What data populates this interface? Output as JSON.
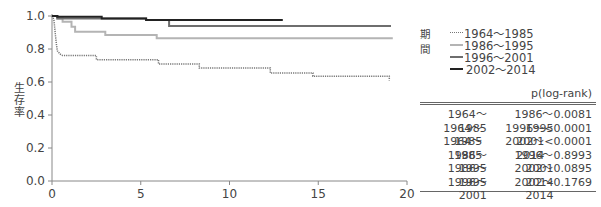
{
  "chart_data": {
    "type": "line",
    "subtype": "kaplan-meier step",
    "title": "",
    "xlabel": "(年)",
    "ylabel": "生存率",
    "xlim": [
      0,
      20
    ],
    "ylim": [
      0,
      1.0
    ],
    "x_ticks": [
      0,
      5,
      10,
      15,
      20
    ],
    "x_tick_labels": [
      "0",
      "5",
      "10",
      "15",
      "20"
    ],
    "y_ticks": [
      0.0,
      0.2,
      0.4,
      0.6,
      0.8,
      1.0
    ],
    "y_tick_labels": [
      "0.0",
      "0.2",
      "0.4",
      "0.6",
      "0.8",
      "1.0"
    ],
    "grid": false,
    "legend_position": "right",
    "legend_title": "期間",
    "series": [
      {
        "name": "1964〜1985",
        "color": "#777777",
        "style": "dotted",
        "width": 1.5,
        "points": [
          [
            0,
            1.0
          ],
          [
            0.1,
            0.98
          ],
          [
            0.15,
            0.93
          ],
          [
            0.2,
            0.88
          ],
          [
            0.25,
            0.83
          ],
          [
            0.3,
            0.79
          ],
          [
            0.45,
            0.77
          ],
          [
            0.6,
            0.76
          ],
          [
            2.5,
            0.76
          ],
          [
            2.5,
            0.735
          ],
          [
            6.0,
            0.735
          ],
          [
            6.0,
            0.71
          ],
          [
            8.3,
            0.71
          ],
          [
            8.3,
            0.685
          ],
          [
            12.3,
            0.685
          ],
          [
            12.3,
            0.655
          ],
          [
            14.7,
            0.655
          ],
          [
            14.7,
            0.635
          ],
          [
            19.0,
            0.635
          ],
          [
            19.0,
            0.61
          ]
        ]
      },
      {
        "name": "1986〜1995",
        "color": "#b4b4b4",
        "style": "solid",
        "width": 2,
        "points": [
          [
            0,
            1.0
          ],
          [
            0.3,
            1.0
          ],
          [
            0.3,
            0.985
          ],
          [
            0.6,
            0.985
          ],
          [
            0.6,
            0.965
          ],
          [
            1.1,
            0.965
          ],
          [
            1.1,
            0.935
          ],
          [
            1.3,
            0.935
          ],
          [
            1.3,
            0.905
          ],
          [
            3.0,
            0.905
          ],
          [
            3.0,
            0.885
          ],
          [
            5.9,
            0.885
          ],
          [
            5.9,
            0.865
          ],
          [
            19.2,
            0.865
          ]
        ]
      },
      {
        "name": "1996〜2001",
        "color": "#6e6e6e",
        "style": "solid",
        "width": 2,
        "points": [
          [
            0,
            1.0
          ],
          [
            0.3,
            1.0
          ],
          [
            0.3,
            0.985
          ],
          [
            5.3,
            0.985
          ],
          [
            5.3,
            0.975
          ],
          [
            6.6,
            0.975
          ],
          [
            6.6,
            0.94
          ],
          [
            19.1,
            0.94
          ]
        ]
      },
      {
        "name": "2002〜2014",
        "color": "#222222",
        "style": "solid",
        "width": 2,
        "points": [
          [
            0,
            1.0
          ],
          [
            0.3,
            1.0
          ],
          [
            0.3,
            0.995
          ],
          [
            2.8,
            0.995
          ],
          [
            2.8,
            0.985
          ],
          [
            5.3,
            0.985
          ],
          [
            5.3,
            0.975
          ],
          [
            13.0,
            0.975
          ]
        ]
      }
    ],
    "logrank_table": {
      "header": [
        "",
        "",
        "p(log-rank)"
      ],
      "rows": [
        [
          "1964〜1985",
          "1986〜1995",
          "0.0081"
        ],
        [
          "1964〜1985",
          "1996〜2001",
          "<0.0001"
        ],
        [
          "1964〜1985",
          "2002〜2014",
          "<0.0001"
        ],
        [
          "1986〜1995",
          "1996〜2001",
          "0.8993"
        ],
        [
          "1986〜1995",
          "2002〜2014",
          "0.0895"
        ],
        [
          "1996〜2001",
          "2002〜2014",
          "0.1769"
        ]
      ]
    }
  },
  "legend": {
    "title": "期間",
    "items": [
      {
        "label": "1964〜1985",
        "color": "#777777",
        "style": "dotted"
      },
      {
        "label": "1986〜1995",
        "color": "#b4b4b4",
        "style": "solid"
      },
      {
        "label": "1996〜2001",
        "color": "#6e6e6e",
        "style": "solid"
      },
      {
        "label": "2002〜2014",
        "color": "#222222",
        "style": "solid"
      }
    ]
  },
  "table": {
    "header": "p(log-rank)",
    "rows": [
      {
        "a": "1964〜1985",
        "b": "1986〜1995",
        "p": "0.0081"
      },
      {
        "a": "1964〜1985",
        "b": "1996〜2001",
        "p": "<0.0001"
      },
      {
        "a": "1964〜1985",
        "b": "2002〜2014",
        "p": "<0.0001"
      },
      {
        "a": "1986〜1995",
        "b": "1996〜2001",
        "p": "0.8993"
      },
      {
        "a": "1986〜1995",
        "b": "2002〜2014",
        "p": "0.0895"
      },
      {
        "a": "1996〜2001",
        "b": "2002〜2014",
        "p": "0.1769"
      }
    ]
  }
}
